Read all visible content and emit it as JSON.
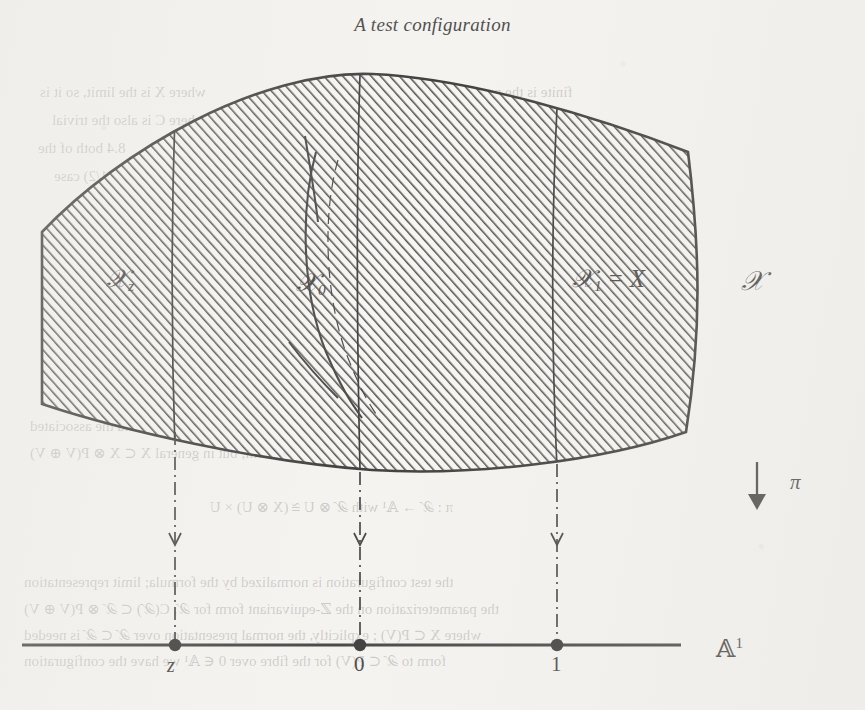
{
  "figure": {
    "title": "A test configuration",
    "total_space_label": "𝒳",
    "projection_label": "π",
    "projection_arrow": "↓",
    "base_space_label": "𝔸",
    "base_space_exponent": "1",
    "fibers": [
      {
        "name": "fiber-z",
        "symbol": "𝒳",
        "subscript": "z",
        "base_point": "z",
        "x": 175
      },
      {
        "name": "fiber-0",
        "symbol": "𝒳",
        "subscript": "0",
        "base_point": "0",
        "x": 360
      },
      {
        "name": "fiber-1",
        "symbol": "𝒳",
        "subscript": "1",
        "base_point": "1",
        "x": 557,
        "equals": "=",
        "identification": "X"
      }
    ],
    "ghost_bleed_lines": [
      {
        "text": "where X is the limit, so it is",
        "x": 40,
        "y": 84,
        "size": 15
      },
      {
        "text": "finite is the natural map",
        "x": 430,
        "y": 84,
        "size": 15
      },
      {
        "text": "where C is also the trivial",
        "x": 52,
        "y": 112,
        "size": 15
      },
      {
        "text": "the formula gives",
        "x": 452,
        "y": 116,
        "size": 15
      },
      {
        "text": "8.4 both of the",
        "x": 38,
        "y": 140,
        "size": 15
      },
      {
        "text": "is the",
        "x": 470,
        "y": 140,
        "size": 15
      },
      {
        "text": "the (1/2) case",
        "x": 54,
        "y": 168,
        "size": 15
      },
      {
        "text": "test",
        "x": 476,
        "y": 168,
        "size": 15
      },
      {
        "text": "when X is viewed as a subscheme, and the associated",
        "x": 30,
        "y": 418,
        "size": 15
      },
      {
        "text": "we get famil-valued form; but in general X ⊂ X ⊗ P(V ⊕ V)",
        "x": 30,
        "y": 444,
        "size": 15
      },
      {
        "text": "π : 𝒳 → 𝔸¹ with 𝒳 ⊗ U ≅ (X ⊗ U) × U",
        "x": 210,
        "y": 498,
        "size": 15
      },
      {
        "text": "the test configuration is normalized by the formula; limit representation",
        "x": 24,
        "y": 574,
        "size": 15
      },
      {
        "text": "the parameterization on the ℤ-equivariant form for 𝒳, C(𝒳) ⊂ 𝒳 ⊗ P(V ⊕ V)",
        "x": 24,
        "y": 600,
        "size": 15
      },
      {
        "text": "where X ⊂ P(V) ; explicitly, the normal presentation over 𝒳 ⊂ 𝒳 is needed",
        "x": 24,
        "y": 626,
        "size": 15
      },
      {
        "text": "form to 𝒳 ⊂ P(V) for the fibre over 0 ∈ 𝔸¹ we have the configuration",
        "x": 24,
        "y": 652,
        "size": 15
      }
    ]
  },
  "colors": {
    "paper": "#f4f3f0",
    "ink": "#1c1c1c",
    "hatch": "#262626",
    "ghost": "rgba(86,84,80,0.33)"
  }
}
